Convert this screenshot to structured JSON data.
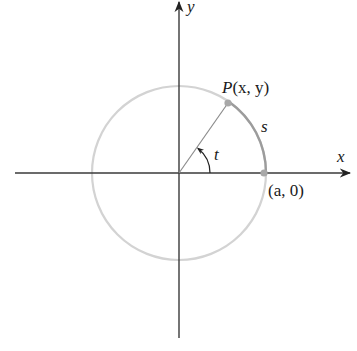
{
  "diagram": {
    "axes": {
      "x_label": "x",
      "y_label": "y"
    },
    "labels": {
      "point_p": "P(x, y)",
      "point_p_name": "P",
      "point_p_coords": "(x, y)",
      "point_a": "(a, 0)",
      "arc": "s",
      "angle": "t"
    },
    "geometry": {
      "origin": [
        179,
        173
      ],
      "radius": 87,
      "angle_deg": 55
    },
    "colors": {
      "axis": "#333333",
      "circle": "#d0d0d0",
      "arc": "#9a9a9a",
      "radius_line": "#8a8a8a",
      "points": "#a8a8a8",
      "text": "#1a1a1a"
    }
  }
}
